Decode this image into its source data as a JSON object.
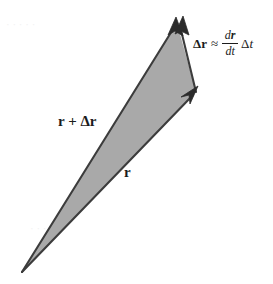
{
  "figure": {
    "name": "displacement-vector-triangle",
    "type": "vector-diagram",
    "width": 273,
    "height": 284,
    "background_color": "#ffffff",
    "fill_color": "#a9a9a9",
    "stroke_color": "#3c3c3c",
    "text_color": "#1c1c1c"
  },
  "labels": {
    "r_plus_delta_r": "r + Δr",
    "r": "r",
    "equation": {
      "lhs": "Δr",
      "relation": "≈",
      "fraction_numerator_d": "d",
      "fraction_numerator_var": "r",
      "fraction_denominator_d": "d",
      "fraction_denominator_var": "t",
      "trailing_delta": "Δ",
      "trailing_var": "t"
    }
  },
  "geometry": {
    "apex_top": [
      177,
      22
    ],
    "vertex_right": [
      196,
      92
    ],
    "apex_bottom_left": [
      22,
      272
    ],
    "arrowheads": [
      {
        "name": "arrowhead-r-plus-delta-r",
        "at": [
          177,
          22
        ],
        "direction": "up-right"
      },
      {
        "name": "arrowhead-r-top",
        "at": [
          182,
          24
        ],
        "direction": "up-right"
      },
      {
        "name": "arrowhead-r-right",
        "at": [
          196,
          92
        ],
        "direction": "up-right"
      }
    ]
  },
  "bleed_text": {
    "line1": "· · · · ·",
    "line2": "· · ·"
  }
}
